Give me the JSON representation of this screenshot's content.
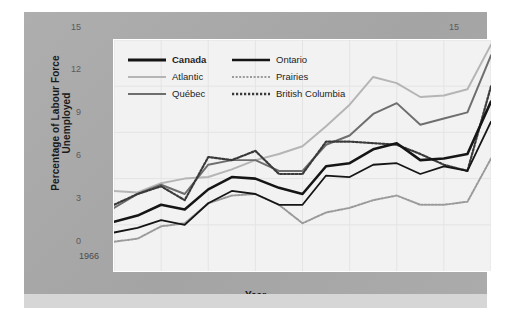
{
  "chart_data": {
    "type": "line",
    "title": "",
    "xlabel": "Year",
    "ylabel": "Percentage of Labour Force Unemployed",
    "xlim": [
      1966,
      1982
    ],
    "ylim": [
      0,
      15
    ],
    "yticks": [
      0,
      3,
      6,
      9,
      12,
      15
    ],
    "xticks": [
      1966,
      1968,
      1970,
      1972,
      1974,
      1976,
      1978,
      1980,
      1982
    ],
    "xtick_labels": [
      "1966",
      "1968",
      "1970",
      "1972",
      "1974",
      "1976",
      "1978",
      "1980",
      "1982"
    ],
    "ytick_labels": [
      "0",
      "3",
      "6",
      "9",
      "12",
      "15"
    ],
    "grid": true,
    "legend_position": "upper-left-inside",
    "x": [
      1966,
      1967,
      1968,
      1969,
      1970,
      1971,
      1972,
      1973,
      1974,
      1975,
      1976,
      1977,
      1978,
      1979,
      1980,
      1981,
      1982
    ],
    "series": [
      {
        "name": "Canada",
        "color": "#151515",
        "style": "solid",
        "width": 2.6,
        "values": [
          3.2,
          3.6,
          4.3,
          4.0,
          5.3,
          6.1,
          6.0,
          5.4,
          5.0,
          6.8,
          7.0,
          7.9,
          8.3,
          7.2,
          7.3,
          7.6,
          11.0
        ]
      },
      {
        "name": "Atlantic",
        "color": "#b5b5b5",
        "style": "solid",
        "width": 2.0,
        "values": [
          5.2,
          5.1,
          5.7,
          6.0,
          6.1,
          6.6,
          7.2,
          7.6,
          8.1,
          9.4,
          10.8,
          12.6,
          12.2,
          11.3,
          11.4,
          11.8,
          14.7
        ]
      },
      {
        "name": "Québec",
        "color": "#6e6e6e",
        "style": "solid",
        "width": 2.0,
        "values": [
          4.1,
          5.0,
          5.6,
          5.0,
          6.9,
          7.2,
          7.2,
          6.5,
          6.5,
          8.2,
          8.8,
          10.2,
          10.9,
          9.5,
          9.9,
          10.3,
          14.0
        ]
      },
      {
        "name": "Ontario",
        "color": "#151515",
        "style": "solid",
        "width": 1.8,
        "values": [
          2.5,
          2.8,
          3.3,
          3.0,
          4.4,
          5.2,
          5.0,
          4.3,
          4.3,
          6.2,
          6.1,
          6.9,
          7.0,
          6.3,
          6.8,
          6.5,
          9.7
        ]
      },
      {
        "name": "Prairies",
        "color": "#9a9a9a",
        "style": "dotted",
        "width": 2.0,
        "values": [
          1.9,
          2.1,
          2.9,
          3.1,
          4.4,
          4.9,
          5.0,
          4.3,
          3.1,
          3.8,
          4.1,
          4.6,
          4.9,
          4.3,
          4.3,
          4.5,
          7.3
        ]
      },
      {
        "name": "British Columbia",
        "color": "#3a3a3a",
        "style": "dotted",
        "width": 2.2,
        "values": [
          4.3,
          5.0,
          5.5,
          4.6,
          7.4,
          7.2,
          7.8,
          6.3,
          6.3,
          8.4,
          8.4,
          8.3,
          8.2,
          7.6,
          6.9,
          6.5,
          12.0
        ]
      }
    ]
  },
  "axis": {
    "y_left_labels": [
      "15",
      "12",
      "9",
      "6",
      "3",
      "0"
    ],
    "y_right_labels": [
      "15",
      "12",
      "9",
      "6",
      "3",
      "0"
    ],
    "x_labels": [
      "1966",
      "1968",
      "1970",
      "1972",
      "1974",
      "1976",
      "1978",
      "1980",
      "1982"
    ],
    "y_title": "Percentage of Labour Force Unemployed",
    "x_title": "Year"
  },
  "legend": {
    "items": [
      {
        "label": "Canada",
        "icon": "line-swatch-solid-black",
        "bold": true
      },
      {
        "label": "Ontario",
        "icon": "line-swatch-solid-black",
        "bold": false
      },
      {
        "label": "Atlantic",
        "icon": "line-swatch-solid-lightgray",
        "bold": false
      },
      {
        "label": "Prairies",
        "icon": "line-swatch-dotted-gray",
        "bold": false
      },
      {
        "label": "Québec",
        "icon": "line-swatch-solid-midgray",
        "bold": false
      },
      {
        "label": "British Columbia",
        "icon": "line-swatch-dotted-dark",
        "bold": false
      }
    ]
  },
  "colors": {
    "panel": "#a9a9a9",
    "plot_bg": "#f2f2f2",
    "grid": "#e2e2e2",
    "canada": "#151515",
    "atlantic": "#b5b5b5",
    "quebec": "#6e6e6e",
    "ontario": "#151515",
    "prairies": "#9a9a9a",
    "british_columbia": "#3a3a3a"
  }
}
